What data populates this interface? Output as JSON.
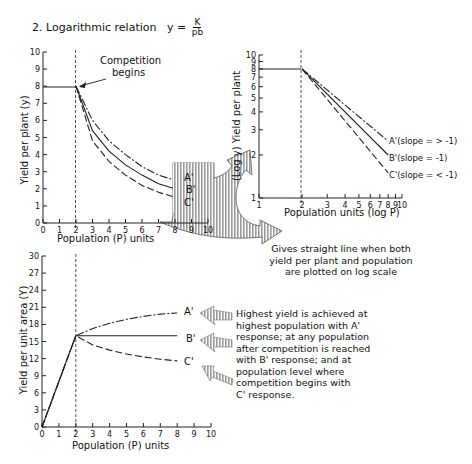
{
  "title": {
    "prefix": "2. Logarithmic relation",
    "formula_lhs": "y =",
    "formula_num": "K",
    "formula_den": "pb"
  },
  "annotations": {
    "competition": "Competition begins",
    "competition_l1": "Competition",
    "competition_l2": "begins",
    "log_note": [
      "Gives straight line when both",
      "yield per plant and population",
      "are plotted on log scale"
    ],
    "area_note": [
      "Highest yield is achieved at",
      "highest population with A'",
      "response; at any population",
      "after competition is reached",
      "with B' response; and at",
      "population level where",
      "competition begins with",
      "C' response."
    ]
  },
  "chart_data": [
    {
      "id": "per-plant-linear",
      "type": "line",
      "title": "",
      "xlabel": "Population (P) units",
      "ylabel": "Yield per plant (y)",
      "xlim": [
        0,
        10
      ],
      "ylim": [
        0,
        10
      ],
      "xticks": [
        "0",
        "1",
        "2",
        "3",
        "4",
        "5",
        "6",
        "7",
        "8",
        "9",
        "10"
      ],
      "yticks": [
        "0",
        "1",
        "2",
        "3",
        "4",
        "5",
        "6",
        "7",
        "8",
        "9",
        "10"
      ],
      "grid": false,
      "vline": {
        "x": 2,
        "style": "dashed"
      },
      "x": [
        0,
        2,
        3,
        4,
        5,
        6,
        7,
        8
      ],
      "series": [
        {
          "name": "A'",
          "style": "dash-dot",
          "values": [
            8,
            8,
            6.0,
            4.8,
            4.0,
            3.3,
            2.8,
            2.5
          ]
        },
        {
          "name": "B'",
          "style": "solid",
          "values": [
            8,
            8,
            5.4,
            4.2,
            3.4,
            2.8,
            2.3,
            2.0
          ]
        },
        {
          "name": "C'",
          "style": "dashed",
          "values": [
            8,
            8,
            4.8,
            3.6,
            2.8,
            2.2,
            1.8,
            1.5
          ]
        }
      ],
      "legend_labels": [
        "A'",
        "B'",
        "C'"
      ]
    },
    {
      "id": "per-plant-log",
      "type": "line",
      "title": "",
      "xlabel": "Population units (log P)",
      "ylabel": "(Log y) Yield per plant",
      "xscale": "log",
      "yscale": "log",
      "xlim": [
        1,
        10
      ],
      "ylim": [
        1,
        10
      ],
      "xticks": [
        "1",
        "2",
        "3",
        "4",
        "5",
        "6",
        "7",
        "8",
        "9",
        "10"
      ],
      "yticks": [
        "1",
        "2",
        "3",
        "4",
        "5",
        "6",
        "7",
        "8",
        "9",
        "10"
      ],
      "grid": false,
      "vline": {
        "x": 2,
        "style": "dashed"
      },
      "x": [
        1,
        2,
        8
      ],
      "series": [
        {
          "name": "A' (slope = > -1)",
          "style": "dash-dot",
          "values": [
            8,
            8,
            2.5
          ]
        },
        {
          "name": "B' (slope = -1)",
          "style": "solid",
          "values": [
            8,
            8,
            2.0
          ]
        },
        {
          "name": "C' (slope = < -1)",
          "style": "dashed",
          "values": [
            8,
            8,
            1.5
          ]
        }
      ],
      "legend_labels": [
        "A'(slope = > -1)",
        "B'(slope = -1)",
        "C'(slope = < -1)"
      ]
    },
    {
      "id": "per-area",
      "type": "line",
      "title": "",
      "xlabel": "Population (P) units",
      "ylabel": "Yield per unit area (Y)",
      "xlim": [
        0,
        10
      ],
      "ylim": [
        0,
        30
      ],
      "xticks": [
        "0",
        "1",
        "2",
        "3",
        "4",
        "5",
        "6",
        "7",
        "8",
        "9",
        "10"
      ],
      "yticks": [
        "0",
        "3",
        "6",
        "9",
        "12",
        "15",
        "18",
        "21",
        "24",
        "27",
        "30"
      ],
      "grid": false,
      "vline": {
        "x": 2,
        "style": "dashed"
      },
      "x": [
        0,
        2,
        3,
        4,
        5,
        6,
        7,
        8
      ],
      "series": [
        {
          "name": "A'",
          "style": "dash-dot",
          "values": [
            0,
            16,
            17.3,
            18.2,
            18.9,
            19.4,
            19.8,
            20.0
          ]
        },
        {
          "name": "B'",
          "style": "solid",
          "values": [
            0,
            16,
            16,
            16,
            16,
            16,
            16,
            16
          ]
        },
        {
          "name": "C'",
          "style": "dashed",
          "values": [
            0,
            16,
            14.4,
            13.5,
            12.8,
            12.3,
            11.9,
            11.6
          ]
        }
      ],
      "legend_labels": [
        "A'",
        "B'",
        "C'"
      ]
    }
  ]
}
